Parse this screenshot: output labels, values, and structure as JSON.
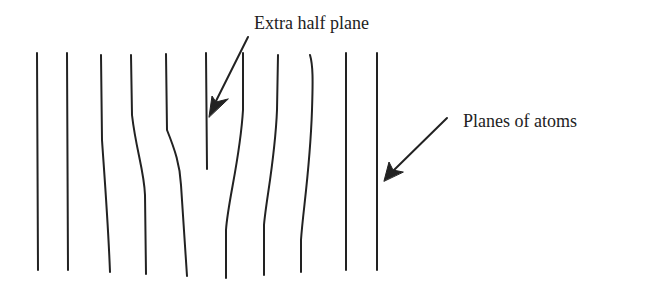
{
  "diagram": {
    "colors": {
      "background": "#ffffff",
      "line": "#222222",
      "text": "#222222"
    },
    "labels": {
      "extra_half_plane": "Extra half plane",
      "planes_of_atoms": "Planes of atoms"
    },
    "planes": [
      {
        "id": 1,
        "path": "M37,53 L38,270"
      },
      {
        "id": 2,
        "path": "M67,53 L68,270"
      },
      {
        "id": 3,
        "path": "M101,55 L102,140 C104,170 108,220 110,272"
      },
      {
        "id": 4,
        "path": "M131,55 L132,115 C136,150 144,170 145,195 L146,274"
      },
      {
        "id": 5,
        "path": "M166,54 L167,130 C175,150 180,165 181,185 L187,276"
      },
      {
        "id": 6,
        "path": "M206,53 L207,169",
        "extra_half_plane": true
      },
      {
        "id": 7,
        "path": "M243,53 L243,110 C240,160 228,200 226,230 L226,278"
      },
      {
        "id": 8,
        "path": "M278,55 L277,110 C275,160 266,200 264,225 L264,275"
      },
      {
        "id": 9,
        "path": "M310,55 C313,65 313,80 312,110 C310,170 303,210 301,240 L301,272"
      },
      {
        "id": 10,
        "path": "M346,53 L346,270"
      },
      {
        "id": 11,
        "path": "M377,53 L377,270"
      }
    ],
    "arrows": [
      {
        "id": "arrow-extra-half-plane",
        "shaft": "M248,37 L216,101",
        "head": "M209,117 L212,96 L216,102 L228,99 Z"
      },
      {
        "id": "arrow-planes-of-atoms",
        "shaft": "M447,118 L393,171",
        "head": "M384,181 L389,162 L393,170 L403,172 Z"
      }
    ]
  }
}
